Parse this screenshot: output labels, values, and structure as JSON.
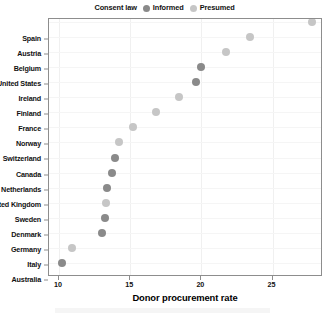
{
  "legend": {
    "title": "Consent law",
    "entries": [
      {
        "label": "Informed",
        "color": "#8a8a8a"
      },
      {
        "label": "Presumed",
        "color": "#c6c6c6"
      }
    ]
  },
  "axes": {
    "x_title": "Donor procurement rate",
    "x_ticks": [
      "10",
      "15",
      "20",
      "25"
    ]
  },
  "chart_data": {
    "type": "scatter",
    "title": "",
    "xlabel": "Donor procurement rate",
    "ylabel": "",
    "xlim": [
      9.3,
      28.4
    ],
    "grid": true,
    "legend_position": "top-center",
    "legend_title": "Consent law",
    "categories": [
      "Spain",
      "Austria",
      "Belgium",
      "United States",
      "Ireland",
      "Finland",
      "France",
      "Norway",
      "Switzerland",
      "Canada",
      "Netherlands",
      "United Kingdom",
      "Sweden",
      "Denmark",
      "Germany",
      "Italy",
      "Australia"
    ],
    "series": [
      {
        "name": "Informed",
        "color": "#8a8a8a",
        "points": [
          {
            "country": "United States",
            "value": 20.0
          },
          {
            "country": "Ireland",
            "value": 19.6
          },
          {
            "country": "Canada",
            "value": 13.9
          },
          {
            "country": "Netherlands",
            "value": 13.7
          },
          {
            "country": "United Kingdom",
            "value": 13.4
          },
          {
            "country": "Denmark",
            "value": 13.2
          },
          {
            "country": "Germany",
            "value": 13.0
          },
          {
            "country": "Australia",
            "value": 10.2
          }
        ]
      },
      {
        "name": "Presumed",
        "color": "#c6c6c6",
        "points": [
          {
            "country": "Spain",
            "value": 27.8
          },
          {
            "country": "Austria",
            "value": 23.4
          },
          {
            "country": "Belgium",
            "value": 21.7
          },
          {
            "country": "Finland",
            "value": 18.4
          },
          {
            "country": "France",
            "value": 16.8
          },
          {
            "country": "Norway",
            "value": 15.2
          },
          {
            "country": "Switzerland",
            "value": 14.2
          },
          {
            "country": "Sweden",
            "value": 13.3
          },
          {
            "country": "Italy",
            "value": 10.9
          }
        ]
      }
    ],
    "values_by_country": {
      "Spain": 27.8,
      "Austria": 23.4,
      "Belgium": 21.7,
      "United States": 20.0,
      "Ireland": 19.6,
      "Finland": 18.4,
      "France": 16.8,
      "Norway": 15.2,
      "Switzerland": 14.2,
      "Canada": 13.9,
      "Netherlands": 13.7,
      "United Kingdom": 13.4,
      "Sweden": 13.3,
      "Denmark": 13.2,
      "Germany": 13.0,
      "Italy": 10.9,
      "Australia": 10.2
    },
    "consent_law_by_country": {
      "Spain": "Presumed",
      "Austria": "Presumed",
      "Belgium": "Presumed",
      "United States": "Informed",
      "Ireland": "Informed",
      "Finland": "Presumed",
      "France": "Presumed",
      "Norway": "Presumed",
      "Switzerland": "Presumed",
      "Canada": "Informed",
      "Netherlands": "Informed",
      "United Kingdom": "Informed",
      "Sweden": "Presumed",
      "Denmark": "Informed",
      "Germany": "Informed",
      "Italy": "Presumed",
      "Australia": "Informed"
    }
  }
}
